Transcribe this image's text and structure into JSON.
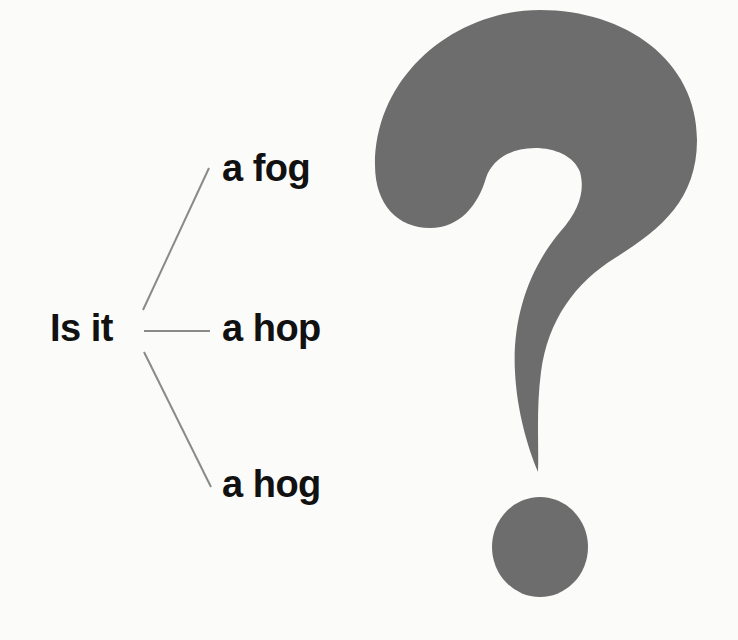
{
  "diagram": {
    "root": {
      "label": "Is it"
    },
    "branches": [
      {
        "label": "a fog"
      },
      {
        "label": "a hop"
      },
      {
        "label": "a hog"
      }
    ],
    "symbol": {
      "name": "question-mark",
      "color": "#6d6d6d"
    },
    "colors": {
      "background": "#fbfbfa",
      "text": "#111111",
      "connector": "#8a8a8a"
    }
  }
}
